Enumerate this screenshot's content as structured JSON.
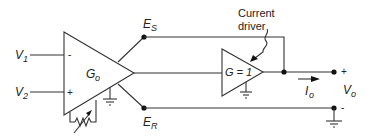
{
  "diagram": {
    "main_amplifier": {
      "gain_label": "G",
      "gain_sub": "o",
      "inverting_sign": "-",
      "noninverting_sign": "+"
    },
    "inputs": [
      {
        "label": "V",
        "sub": "1"
      },
      {
        "label": "V",
        "sub": "2"
      }
    ],
    "sense_terminal": {
      "label": "E",
      "sub": "S"
    },
    "reference_terminal": {
      "label": "E",
      "sub": "R"
    },
    "driver": {
      "caption_line1": "Current",
      "caption_line2": "driver",
      "gain_label": "G = 1"
    },
    "output": {
      "current_label": "I",
      "current_sub": "o",
      "voltage_label": "V",
      "voltage_sub": "o",
      "plus_sign": "+",
      "minus_sign": "-"
    },
    "colors": {
      "line": "#333333",
      "background": "#ffffff"
    }
  }
}
